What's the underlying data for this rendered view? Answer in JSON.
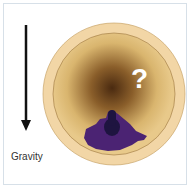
{
  "diagram": {
    "label_gravity": "Gravity",
    "question_mark": "?",
    "colors": {
      "frame": "#d7e0e8",
      "outer_ring": "#f2d6a6",
      "inner_fill": "#e3c07a",
      "center_dark": "#4a2a10",
      "blob": "#4b2373",
      "blob_core": "#1e1440",
      "arrow": "#111111"
    }
  }
}
